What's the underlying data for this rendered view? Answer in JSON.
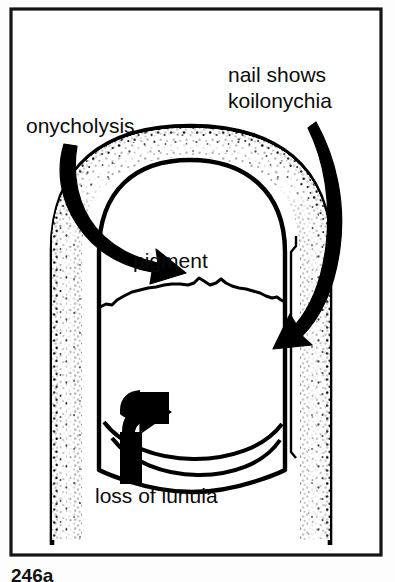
{
  "figure": {
    "caption": "246a",
    "border_color": "#111111",
    "ink_color": "#000000",
    "paper_color": "#ffffff",
    "labels": {
      "onycholysis": "onycholysis",
      "nail_shows_line1": "nail shows",
      "nail_shows_line2": "koilonychia",
      "pigment": "pigment",
      "loss_of_lunula": "loss of lunula"
    },
    "annotations": [
      {
        "name": "onycholysis",
        "text": "onycholysis",
        "arrow": "curved-arrow-down-right",
        "points_to": "proximal-left nail fold / separated nail plate"
      },
      {
        "name": "koilonychia",
        "text": "nail shows koilonychia",
        "arrow": "curved-arrow-down-left",
        "points_to": "right lateral nail edge"
      },
      {
        "name": "pigment",
        "text": "pigment",
        "arrow": "none",
        "points_to": "upper nail plate pigmented band"
      },
      {
        "name": "loss-of-lunula",
        "text": "loss of lunula",
        "arrow": "curved-arrow-up-right",
        "points_to": "distal nail margin where lunula is absent"
      }
    ],
    "parts": [
      "finger-outline",
      "stippled-skin-texture",
      "nail-plate-outline",
      "pigment-boundary-line",
      "distal-nail-margin-lines",
      "lateral-nail-fold-line"
    ]
  }
}
